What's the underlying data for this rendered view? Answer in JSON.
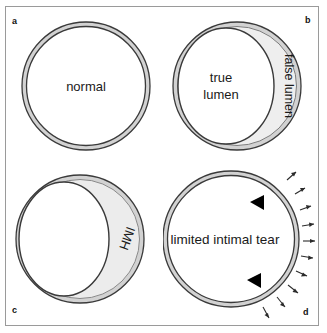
{
  "figure": {
    "background_color": "#ffffff",
    "border_color": "#9a9a9a",
    "wall_outline_color": "#3a3a3a",
    "wall_fill_color": "#d2d2d2",
    "lesion_fill_color": "#e8e8e8",
    "marker_color": "#000000"
  },
  "panels": [
    {
      "letter": "a",
      "name": "normal",
      "labels": [
        {
          "text": "normal",
          "rotation": 0
        }
      ],
      "markers": {
        "arrowheads": 0,
        "ticks": 0
      }
    },
    {
      "letter": "b",
      "name": "classic-dissection",
      "labels": [
        {
          "text": "true",
          "rotation": 0
        },
        {
          "text": "lumen",
          "rotation": 0
        },
        {
          "text": "false lumen",
          "rotation": 90
        }
      ],
      "markers": {
        "arrowheads": 0,
        "ticks": 0
      }
    },
    {
      "letter": "c",
      "name": "intramural-hematoma",
      "labels": [
        {
          "text": "IMH",
          "rotation": 110
        }
      ],
      "markers": {
        "arrowheads": 0,
        "ticks": 0
      }
    },
    {
      "letter": "d",
      "name": "limited-intimal-tear",
      "labels": [
        {
          "text": "limited intimal tear",
          "rotation": 0
        }
      ],
      "markers": {
        "arrowheads": 2,
        "ticks": 10
      }
    }
  ]
}
